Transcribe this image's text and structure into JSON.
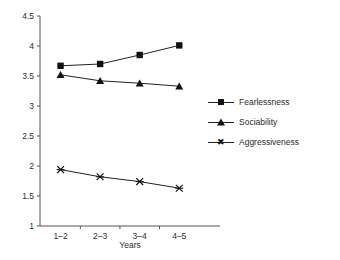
{
  "chart_data": {
    "type": "line",
    "title": "",
    "xlabel": "Years",
    "ylabel": "",
    "categories": [
      "1–2",
      "2–3",
      "3–4",
      "4–5"
    ],
    "series": [
      {
        "name": "Fearlessness",
        "marker": "square",
        "values": [
          3.67,
          3.7,
          3.85,
          4.01
        ]
      },
      {
        "name": "Sociability",
        "marker": "triangle",
        "values": [
          3.52,
          3.42,
          3.38,
          3.33
        ]
      },
      {
        "name": "Aggressiveness",
        "marker": "cross",
        "values": [
          1.94,
          1.82,
          1.74,
          1.63
        ]
      }
    ],
    "ylim": [
      1,
      4.5
    ],
    "yticks": [
      "1",
      "1.5",
      "2",
      "2.5",
      "3",
      "3.5",
      "4",
      "4.5"
    ],
    "ytick_values": [
      1,
      1.5,
      2,
      2.5,
      3,
      3.5,
      4,
      4.5
    ],
    "grid": false,
    "legend_position": "right",
    "line_color": "#222222",
    "marker_color": "#111111",
    "axis_color": "#555555",
    "background": "#ffffff"
  },
  "legend": {
    "items": [
      {
        "label": "Fearlessness"
      },
      {
        "label": "Sociability"
      },
      {
        "label": "Aggressiveness"
      }
    ]
  },
  "axis": {
    "x_title": "Years"
  }
}
